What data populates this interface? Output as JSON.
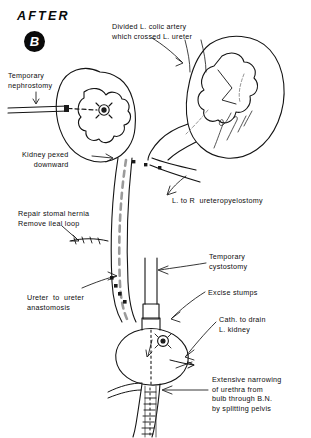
{
  "figure": {
    "title": "AFTER",
    "panel_letter": "B",
    "signature": "Netter",
    "background_color": "#ffffff",
    "ink_color": "#101010"
  },
  "labels": {
    "divided_colic": "Divided L. colic artery\nwhich crossed L. ureter",
    "temporary_nephrostomy": "Temporary\nnephrostomy",
    "kidney_pexed": "Kidney pexed\ndownward",
    "repair_hernia": "Repair stomal hernia\nRemove ileal loop",
    "ureteropyelostomy": "L. to R  ureteropyelostomy",
    "temporary_cystostomy": "Temporary\ncystostomy",
    "excise_stumps": "Excise stumps",
    "cath_to_drain": "Cath. to drain\nL. kidney",
    "ureter_anastomosis": "Ureter  to  ureter\nanastomosis",
    "extensive_narrowing": "Extensive narrowing\nof urethra from\nbulb through B.N.\nby splitting pelvis"
  }
}
